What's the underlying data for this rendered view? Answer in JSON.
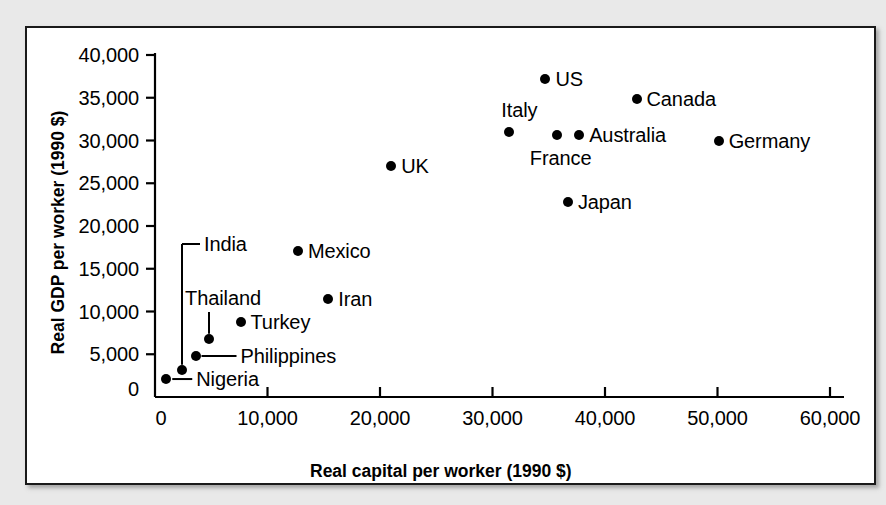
{
  "chart_data": {
    "type": "scatter",
    "title": "",
    "xlabel": "Real capital per worker (1990 $)",
    "ylabel": "Real GDP per worker (1990 $)",
    "xlim": [
      0,
      60000
    ],
    "ylim": [
      0,
      40000
    ],
    "xticks": [
      0,
      10000,
      20000,
      30000,
      40000,
      50000,
      60000
    ],
    "xtick_labels": [
      "0",
      "10,000",
      "20,000",
      "30,000",
      "40,000",
      "50,000",
      "60,000"
    ],
    "yticks": [
      0,
      5000,
      10000,
      15000,
      20000,
      25000,
      30000,
      35000,
      40000
    ],
    "ytick_labels": [
      "0",
      "5,000",
      "10,000",
      "15,000",
      "20,000",
      "25,000",
      "30,000",
      "35,000",
      "40,000"
    ],
    "grid": false,
    "legend": "none",
    "marker_color": "#000000",
    "points": [
      {
        "name": "Nigeria",
        "x": 1000,
        "y": 2100,
        "label": "Nigeria",
        "label_pos": "leader-right"
      },
      {
        "name": "India",
        "x": 2400,
        "y": 3200,
        "label": "India",
        "label_pos": "leader-up"
      },
      {
        "name": "Philippines",
        "x": 3600,
        "y": 4800,
        "label": "Philippines",
        "label_pos": "leader-right"
      },
      {
        "name": "Thailand",
        "x": 4800,
        "y": 6800,
        "label": "Thailand",
        "label_pos": "leader-up"
      },
      {
        "name": "Turkey",
        "x": 7600,
        "y": 8800,
        "label": "Turkey",
        "label_pos": "right"
      },
      {
        "name": "Mexico",
        "x": 12700,
        "y": 17100,
        "label": "Mexico",
        "label_pos": "right"
      },
      {
        "name": "Iran",
        "x": 15400,
        "y": 11500,
        "label": "Iran",
        "label_pos": "right"
      },
      {
        "name": "UK",
        "x": 21000,
        "y": 27000,
        "label": "UK",
        "label_pos": "right"
      },
      {
        "name": "Italy",
        "x": 31500,
        "y": 31000,
        "label": "Italy",
        "label_pos": "above"
      },
      {
        "name": "US",
        "x": 34700,
        "y": 37200,
        "label": "US",
        "label_pos": "right"
      },
      {
        "name": "France",
        "x": 35700,
        "y": 30700,
        "label": "France",
        "label_pos": "below"
      },
      {
        "name": "Japan",
        "x": 36700,
        "y": 22800,
        "label": "Japan",
        "label_pos": "right"
      },
      {
        "name": "Australia",
        "x": 37700,
        "y": 30700,
        "label": "Australia",
        "label_pos": "right"
      },
      {
        "name": "Canada",
        "x": 42800,
        "y": 34900,
        "label": "Canada",
        "label_pos": "right"
      },
      {
        "name": "Germany",
        "x": 50100,
        "y": 29900,
        "label": "Germany",
        "label_pos": "right"
      }
    ]
  },
  "figure": {
    "background_color": "#e9e9e9",
    "panel_color": "#ffffff",
    "border_color": "#1a1a1a",
    "axis_color": "#000000"
  }
}
